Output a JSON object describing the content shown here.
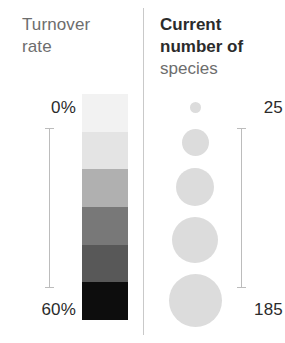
{
  "legend": {
    "left_panel": {
      "title": "Turnover\nrate",
      "title_line1": "Turnover",
      "title_line2": "rate",
      "min_label": "0%",
      "max_label": "60%",
      "axis_name": "turnover-rate-axis"
    },
    "right_panel": {
      "title_bold_line1": "Current",
      "title_bold_line2": "number of",
      "title_light_line3": "species",
      "min_label": "25",
      "max_label": "185",
      "axis_name": "species-count-axis"
    }
  },
  "chart_data": {
    "type": "legend",
    "panels": [
      {
        "name": "Turnover rate",
        "encoding": "color",
        "type": "sequential-gray-ramp",
        "unit": "%",
        "range": [
          0,
          60
        ],
        "min_label": "0%",
        "max_label": "60%",
        "bands": [
          {
            "value_range": [
              0,
              10
            ],
            "color": "#f2f2f2"
          },
          {
            "value_range": [
              10,
              20
            ],
            "color": "#e4e4e4"
          },
          {
            "value_range": [
              20,
              30
            ],
            "color": "#b0b0b0"
          },
          {
            "value_range": [
              30,
              40
            ],
            "color": "#787878"
          },
          {
            "value_range": [
              40,
              50
            ],
            "color": "#585858"
          },
          {
            "value_range": [
              50,
              60
            ],
            "color": "#0d0d0d"
          }
        ]
      },
      {
        "name": "Current number of species",
        "encoding": "size",
        "type": "proportional-circles",
        "unit": "species",
        "range": [
          25,
          185
        ],
        "min_label": "25",
        "max_label": "185",
        "circle_color": "#dcdcdc",
        "circles": [
          {
            "value": 25,
            "diameter_px": 11
          },
          {
            "value": 65,
            "diameter_px": 27
          },
          {
            "value": 105,
            "diameter_px": 38
          },
          {
            "value": 145,
            "diameter_px": 46
          },
          {
            "value": 185,
            "diameter_px": 53
          }
        ]
      }
    ],
    "colors": {
      "text_dark": "#2b2b2b",
      "text_muted": "#6d6d6d",
      "axis_line": "#bcbcbc",
      "divider": "#c9c9c9",
      "background": "#ffffff"
    }
  }
}
